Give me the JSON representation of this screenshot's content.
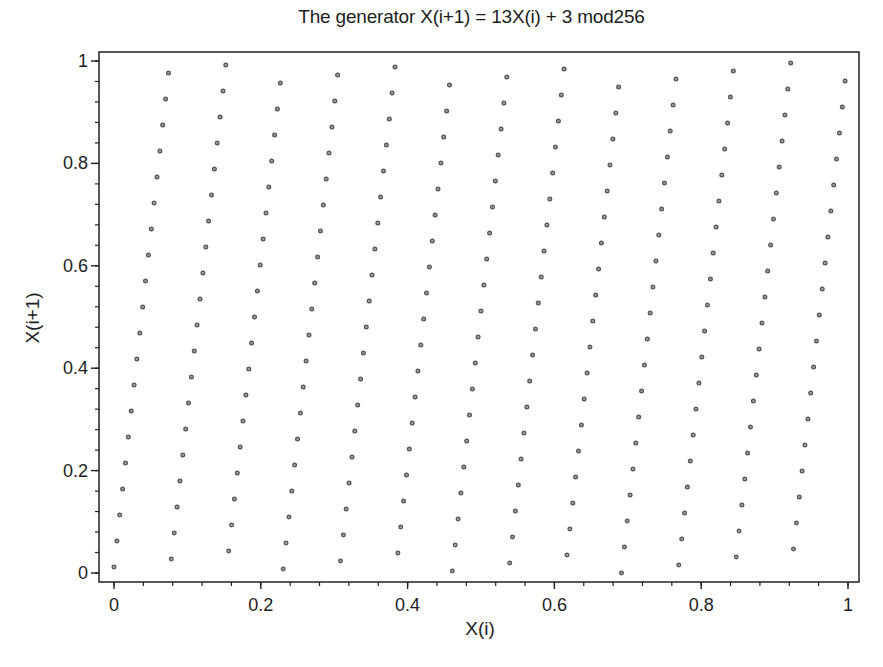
{
  "chart_data": {
    "type": "scatter",
    "title": "The generator X(i+1) = 13X(i) + 3 mod256",
    "xlabel": "X(i)",
    "ylabel": "X(i+1)",
    "xlim": [
      0,
      1
    ],
    "ylim": [
      0,
      1
    ],
    "grid": false,
    "legend": null,
    "xticks": [
      0,
      0.2,
      0.4,
      0.6,
      0.8,
      1
    ],
    "xtick_labels": [
      "0",
      "0.2",
      "0.4",
      "0.6",
      "0.8",
      "1"
    ],
    "yticks": [
      0,
      0.2,
      0.4,
      0.6,
      0.8,
      1
    ],
    "ytick_labels": [
      "0",
      "0.2",
      "0.4",
      "0.6",
      "0.8",
      "1"
    ],
    "minor_tick_step": 0.04,
    "marker": {
      "shape": "circle",
      "size": 5,
      "edge_color": "#555555",
      "face_color": "#9a9a9a"
    },
    "generator": {
      "multiplier": 13,
      "increment": 3,
      "modulus": 256
    },
    "denominator": 256,
    "x_numerators": [
      0,
      1,
      2,
      3,
      4,
      5,
      6,
      7,
      8,
      9,
      10,
      11,
      12,
      13,
      14,
      15,
      16,
      17,
      18,
      19,
      20,
      21,
      22,
      23,
      24,
      25,
      26,
      27,
      28,
      29,
      30,
      31,
      32,
      33,
      34,
      35,
      36,
      37,
      38,
      39,
      40,
      41,
      42,
      43,
      44,
      45,
      46,
      47,
      48,
      49,
      50,
      51,
      52,
      53,
      54,
      55,
      56,
      57,
      58,
      59,
      60,
      61,
      62,
      63,
      64,
      65,
      66,
      67,
      68,
      69,
      70,
      71,
      72,
      73,
      74,
      75,
      76,
      77,
      78,
      79,
      80,
      81,
      82,
      83,
      84,
      85,
      86,
      87,
      88,
      89,
      90,
      91,
      92,
      93,
      94,
      95,
      96,
      97,
      98,
      99,
      100,
      101,
      102,
      103,
      104,
      105,
      106,
      107,
      108,
      109,
      110,
      111,
      112,
      113,
      114,
      115,
      116,
      117,
      118,
      119,
      120,
      121,
      122,
      123,
      124,
      125,
      126,
      127,
      128,
      129,
      130,
      131,
      132,
      133,
      134,
      135,
      136,
      137,
      138,
      139,
      140,
      141,
      142,
      143,
      144,
      145,
      146,
      147,
      148,
      149,
      150,
      151,
      152,
      153,
      154,
      155,
      156,
      157,
      158,
      159,
      160,
      161,
      162,
      163,
      164,
      165,
      166,
      167,
      168,
      169,
      170,
      171,
      172,
      173,
      174,
      175,
      176,
      177,
      178,
      179,
      180,
      181,
      182,
      183,
      184,
      185,
      186,
      187,
      188,
      189,
      190,
      191,
      192,
      193,
      194,
      195,
      196,
      197,
      198,
      199,
      200,
      201,
      202,
      203,
      204,
      205,
      206,
      207,
      208,
      209,
      210,
      211,
      212,
      213,
      214,
      215,
      216,
      217,
      218,
      219,
      220,
      221,
      222,
      223,
      224,
      225,
      226,
      227,
      228,
      229,
      230,
      231,
      232,
      233,
      234,
      235,
      236,
      237,
      238,
      239,
      240,
      241,
      242,
      243,
      244,
      245,
      246,
      247,
      248,
      249,
      250,
      251,
      252,
      253,
      254,
      255
    ],
    "y_numerators": [
      3,
      16,
      29,
      42,
      55,
      68,
      81,
      94,
      107,
      120,
      133,
      146,
      159,
      172,
      185,
      198,
      211,
      224,
      237,
      250,
      7,
      20,
      33,
      46,
      59,
      72,
      85,
      98,
      111,
      124,
      137,
      150,
      163,
      176,
      189,
      202,
      215,
      228,
      241,
      254,
      11,
      24,
      37,
      50,
      63,
      76,
      89,
      102,
      115,
      128,
      141,
      154,
      167,
      180,
      193,
      206,
      219,
      232,
      245,
      2,
      15,
      28,
      41,
      54,
      67,
      80,
      93,
      106,
      119,
      132,
      145,
      158,
      171,
      184,
      197,
      210,
      223,
      236,
      249,
      6,
      19,
      32,
      45,
      58,
      71,
      84,
      97,
      110,
      123,
      136,
      149,
      162,
      175,
      188,
      201,
      214,
      227,
      240,
      253,
      10,
      23,
      36,
      49,
      62,
      75,
      88,
      101,
      114,
      127,
      140,
      153,
      166,
      179,
      192,
      205,
      218,
      231,
      244,
      1,
      14,
      27,
      40,
      53,
      66,
      79,
      92,
      105,
      118,
      131,
      144,
      157,
      170,
      183,
      196,
      209,
      222,
      235,
      248,
      5,
      18,
      31,
      44,
      57,
      70,
      83,
      96,
      109,
      122,
      135,
      148,
      161,
      174,
      187,
      200,
      213,
      226,
      239,
      252,
      9,
      22,
      35,
      48,
      61,
      74,
      87,
      100,
      113,
      126,
      139,
      152,
      165,
      178,
      191,
      204,
      217,
      230,
      243,
      0,
      13,
      26,
      39,
      52,
      65,
      78,
      91,
      104,
      117,
      130,
      143,
      156,
      169,
      182,
      195,
      208,
      221,
      234,
      247,
      4,
      17,
      30,
      43,
      56,
      69,
      82,
      95,
      108,
      121,
      134,
      147,
      160,
      173,
      186,
      199,
      212,
      225,
      238,
      251,
      8,
      21,
      34,
      47,
      60,
      73,
      86,
      99,
      112,
      125,
      138,
      151,
      164,
      177,
      190,
      203,
      216,
      229,
      242,
      255,
      12,
      25,
      38,
      51,
      64,
      77,
      90,
      103,
      116,
      129,
      142,
      155,
      168,
      181,
      194,
      207,
      220,
      233,
      246
    ]
  },
  "colors": {
    "background": "#ffffff",
    "axis": "#222222",
    "text": "#1e1e1e"
  }
}
